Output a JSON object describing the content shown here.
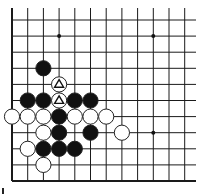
{
  "board": {
    "colors": {
      "line": "#1a1a1a",
      "black": "#111111",
      "white": "#ffffff",
      "stroke": "#222222",
      "background": "#ffffff"
    },
    "grid": {
      "columns_x": [
        12,
        27.7,
        43.4,
        59.1,
        74.8,
        90.5,
        106.2,
        121.9,
        137.6,
        153.3,
        169,
        184.7
      ],
      "rows_y": [
        20,
        36.1,
        52.2,
        68.3,
        84.4,
        100.5,
        116.6,
        132.7,
        148.8,
        164.9,
        181
      ],
      "right_open_edge_x": 196,
      "top_open_edge_y": 8,
      "left_edge_closed": true,
      "bottom_edge_closed": true
    },
    "star_points": [
      {
        "col": 3,
        "row": 1
      },
      {
        "col": 9,
        "row": 1
      },
      {
        "col": 9,
        "row": 7
      }
    ],
    "stones": [
      {
        "color": "black",
        "col": 2,
        "row": 3
      },
      {
        "color": "white",
        "col": 3,
        "row": 4,
        "mark": "triangle"
      },
      {
        "color": "black",
        "col": 1,
        "row": 5
      },
      {
        "color": "black",
        "col": 2,
        "row": 5
      },
      {
        "color": "white",
        "col": 3,
        "row": 5,
        "mark": "triangle"
      },
      {
        "color": "black",
        "col": 4,
        "row": 5
      },
      {
        "color": "black",
        "col": 5,
        "row": 5
      },
      {
        "color": "white",
        "col": 0,
        "row": 6
      },
      {
        "color": "white",
        "col": 1,
        "row": 6
      },
      {
        "color": "white",
        "col": 2,
        "row": 6
      },
      {
        "color": "black",
        "col": 3,
        "row": 6
      },
      {
        "color": "white",
        "col": 4,
        "row": 6
      },
      {
        "color": "white",
        "col": 5,
        "row": 6
      },
      {
        "color": "white",
        "col": 6,
        "row": 6
      },
      {
        "color": "white",
        "col": 2,
        "row": 7
      },
      {
        "color": "black",
        "col": 3,
        "row": 7
      },
      {
        "color": "black",
        "col": 5,
        "row": 7
      },
      {
        "color": "white",
        "col": 7,
        "row": 7
      },
      {
        "color": "white",
        "col": 1,
        "row": 8
      },
      {
        "color": "black",
        "col": 2,
        "row": 8
      },
      {
        "color": "black",
        "col": 3,
        "row": 8
      },
      {
        "color": "black",
        "col": 4,
        "row": 8
      },
      {
        "color": "white",
        "col": 2,
        "row": 9
      }
    ],
    "stone_radius": 7.6
  }
}
